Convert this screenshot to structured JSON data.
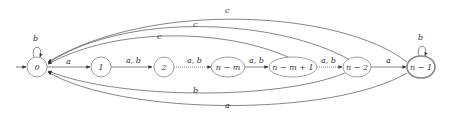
{
  "diagram": {
    "type": "finite-automaton",
    "nodes": [
      {
        "id": "0",
        "label": "0",
        "start": true,
        "accept": false
      },
      {
        "id": "1",
        "label": "1",
        "start": false,
        "accept": false
      },
      {
        "id": "2",
        "label": "2",
        "start": false,
        "accept": false
      },
      {
        "id": "n-m",
        "label": "n − m",
        "start": false,
        "accept": false
      },
      {
        "id": "n-m+1",
        "label": "n − m + 1",
        "start": false,
        "accept": false
      },
      {
        "id": "n-2",
        "label": "n − 2",
        "start": false,
        "accept": false
      },
      {
        "id": "n-1",
        "label": "n − 1",
        "start": false,
        "accept": true
      }
    ],
    "edges": [
      {
        "from": "0",
        "to": "0",
        "label": "b"
      },
      {
        "from": "0",
        "to": "1",
        "label": "a"
      },
      {
        "from": "1",
        "to": "2",
        "label": "a, b"
      },
      {
        "from": "2",
        "to": "n-m",
        "label": "a, b"
      },
      {
        "from": "n-m",
        "to": "n-m+1",
        "label": "a, b"
      },
      {
        "from": "n-m+1",
        "to": "n-2",
        "label": "a, b"
      },
      {
        "from": "n-2",
        "to": "n-1",
        "label": "a"
      },
      {
        "from": "n-1",
        "to": "n-1",
        "label": "b"
      },
      {
        "from": "n-1",
        "to": "0",
        "label": "c"
      },
      {
        "from": "n-2",
        "to": "0",
        "label": "c"
      },
      {
        "from": "n-m+1",
        "to": "0",
        "label": "c"
      },
      {
        "from": "n-2",
        "to": "0",
        "label": "b"
      },
      {
        "from": "n-1",
        "to": "0",
        "label": "a"
      }
    ]
  },
  "labels": {
    "n0": "0",
    "n1": "1",
    "n2": "2",
    "nm": "n − m",
    "nm1": "n − m + 1",
    "n2b": "n − 2",
    "n1b": "n − 1",
    "loop0": "b",
    "e01": "a",
    "e12": "a, b",
    "e2m": "a, b",
    "em_m1": "a, b",
    "em1_n2": "a, b",
    "en2_n1": "a",
    "loopn1": "b",
    "c_top": "c",
    "c_mid": "c",
    "c_low": "c",
    "b_back": "b",
    "a_back": "a"
  }
}
